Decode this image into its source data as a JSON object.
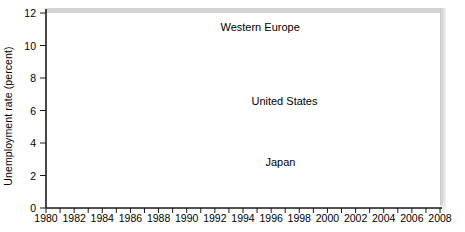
{
  "chart_data": {
    "type": "line",
    "title": "",
    "xlabel": "",
    "ylabel": "Unemployment rate (percent)",
    "xlim": [
      1980,
      2008
    ],
    "ylim": [
      0,
      12
    ],
    "yticks": [
      0,
      2,
      4,
      6,
      8,
      10,
      12
    ],
    "xticks": [
      1980,
      1982,
      1984,
      1986,
      1988,
      1990,
      1992,
      1994,
      1996,
      1998,
      2000,
      2002,
      2004,
      2006,
      2008
    ],
    "x": [
      1980,
      1981,
      1982,
      1983,
      1984,
      1985,
      1986,
      1987,
      1988,
      1989,
      1990,
      1991,
      1992,
      1993,
      1994,
      1995,
      1996,
      1997,
      1998,
      1999,
      2000,
      2001,
      2002,
      2003,
      2004,
      2005,
      2006,
      2007,
      2008
    ],
    "grid": true,
    "legend": "inline-labels",
    "series": [
      {
        "name": "Western Europe",
        "color": "#8d8d8d",
        "label_x": 1992.4,
        "label_y": 11.05,
        "values": [
          5.1,
          6.0,
          7.1,
          8.0,
          8.4,
          8.7,
          9.0,
          8.9,
          8.4,
          7.7,
          6.8,
          7.2,
          7.9,
          9.4,
          10.1,
          9.9,
          10.0,
          10.0,
          9.6,
          8.9,
          8.0,
          7.6,
          7.8,
          8.0,
          8.2,
          8.4,
          8.0,
          6.9,
          6.8
        ]
      },
      {
        "name": "United States",
        "color": "#2b2b2b",
        "label_x": 1994.6,
        "label_y": 6.55,
        "values": [
          7.1,
          7.6,
          9.7,
          9.6,
          7.5,
          7.2,
          7.0,
          6.2,
          5.5,
          5.3,
          5.6,
          6.8,
          7.5,
          6.9,
          6.1,
          5.6,
          5.4,
          4.9,
          4.5,
          4.2,
          4.0,
          4.8,
          5.8,
          6.0,
          5.5,
          5.1,
          4.6,
          4.8,
          7.1
        ]
      },
      {
        "name": "Japan",
        "color": "#7e7e7e",
        "label_x": 1995.6,
        "label_y": 2.75,
        "values": [
          2.0,
          2.2,
          2.4,
          2.7,
          2.7,
          2.6,
          2.8,
          2.8,
          2.5,
          2.3,
          2.1,
          2.1,
          2.2,
          2.5,
          2.9,
          3.2,
          3.4,
          3.4,
          4.1,
          4.7,
          4.7,
          5.0,
          5.4,
          5.2,
          4.7,
          4.4,
          4.1,
          3.9,
          4.0
        ]
      }
    ]
  }
}
